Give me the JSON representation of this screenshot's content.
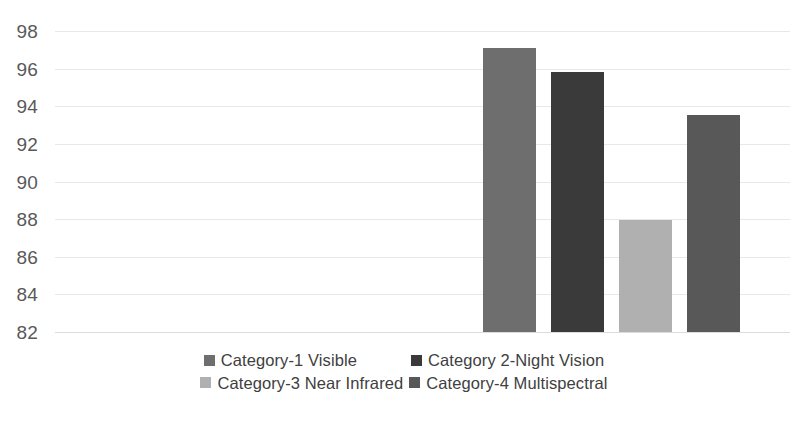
{
  "chart_data": {
    "type": "bar",
    "title": "",
    "xlabel": "",
    "ylabel": "",
    "ylim": [
      82,
      98
    ],
    "ytick_step": 2,
    "yticks": [
      "98",
      "96",
      "94",
      "92",
      "90",
      "88",
      "86",
      "84",
      "82"
    ],
    "grid": true,
    "legend_position": "bottom",
    "categories": [
      "Category-1 Visible",
      "Category 2-Night Vision",
      "Category-3 Near Infrared",
      "Category-4 Multispectral"
    ],
    "values": [
      97.1,
      95.8,
      87.95,
      93.55
    ],
    "colors": [
      "#6e6e6e",
      "#3a3a3a",
      "#b0b0b0",
      "#585858"
    ],
    "series": [
      {
        "name": "Accuracy",
        "values": [
          97.1,
          95.8,
          87.95,
          93.55
        ]
      }
    ]
  },
  "axis": {
    "y_ticks": [
      {
        "label": "98",
        "value": 98
      },
      {
        "label": "96",
        "value": 96
      },
      {
        "label": "94",
        "value": 94
      },
      {
        "label": "92",
        "value": 92
      },
      {
        "label": "90",
        "value": 90
      },
      {
        "label": "88",
        "value": 88
      },
      {
        "label": "86",
        "value": 86
      },
      {
        "label": "84",
        "value": 84
      },
      {
        "label": "82",
        "value": 82
      }
    ]
  },
  "legend": {
    "rows": [
      [
        {
          "label": "Category-1 Visible",
          "color": "#6e6e6e"
        },
        {
          "label": "Category 2-Night Vision",
          "color": "#3a3a3a"
        }
      ],
      [
        {
          "label": "Category-3 Near Infrared",
          "color": "#b0b0b0"
        },
        {
          "label": "Category-4 Multispectral",
          "color": "#585858"
        }
      ]
    ]
  }
}
